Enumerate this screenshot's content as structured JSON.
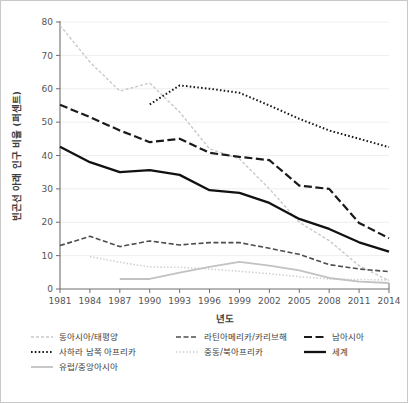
{
  "chart_data": {
    "type": "line",
    "title": "",
    "xlabel": "년도",
    "ylabel": "빈곤선 아래 인구 비율 (퍼센트)",
    "xlim": [
      1981,
      2014
    ],
    "ylim": [
      0,
      80
    ],
    "ytick_step": 10,
    "grid": true,
    "legend_position": "bottom",
    "x": [
      1981,
      1984,
      1987,
      1990,
      1993,
      1996,
      1999,
      2002,
      2005,
      2008,
      2011,
      2014
    ],
    "xtick_labels": [
      "1981",
      "1984",
      "1987",
      "1990",
      "1993",
      "1996",
      "1999",
      "2002",
      "2005",
      "2008",
      "2011",
      "2014"
    ],
    "ytick_labels": [
      "0",
      "10",
      "20",
      "30",
      "40",
      "50",
      "60",
      "70",
      "80"
    ],
    "series": [
      {
        "name": "동아시아/태평양",
        "color": "#c9c9c9",
        "width": 1.4,
        "dash": "3,2",
        "values": [
          79.0,
          68.0,
          59.3,
          61.7,
          53.0,
          42.0,
          39.0,
          30.0,
          20.0,
          14.5,
          7.0,
          2.5
        ]
      },
      {
        "name": "라틴아메리카/카리브해",
        "color": "#4d4d4d",
        "width": 1.6,
        "dash": "5,2.5",
        "values": [
          13.0,
          15.8,
          12.7,
          14.4,
          13.2,
          13.9,
          13.9,
          12.2,
          10.4,
          7.3,
          6.0,
          5.2
        ]
      },
      {
        "name": "남아시아",
        "color": "#1a1a1a",
        "width": 2.2,
        "dash": "8,3.5",
        "values": [
          55.2,
          51.5,
          47.5,
          44.0,
          45.0,
          40.8,
          39.6,
          38.6,
          31.0,
          30.0,
          19.8,
          15.2
        ]
      },
      {
        "name": "사하라 남쪽 아프리카",
        "color": "#1a1a1a",
        "width": 2.0,
        "dash": "1.6,2.2",
        "values": [
          null,
          null,
          null,
          55.3,
          61.0,
          60.0,
          58.8,
          55.0,
          51.0,
          47.5,
          45.0,
          42.5
        ]
      },
      {
        "name": "중동/북아프리카",
        "color": "#cfcfcf",
        "width": 1.6,
        "dash": "1.4,2",
        "values": [
          null,
          9.7,
          8.0,
          6.6,
          6.5,
          6.0,
          5.3,
          4.6,
          3.7,
          3.0,
          2.8,
          2.7
        ]
      },
      {
        "name": "유럽/중앙아시아",
        "color": "#c2c2c2",
        "width": 1.8,
        "dash": "",
        "values": [
          null,
          null,
          3.0,
          3.0,
          4.9,
          6.6,
          8.1,
          7.0,
          5.6,
          3.3,
          2.2,
          1.8
        ]
      },
      {
        "name": "세계",
        "color": "#111111",
        "width": 2.3,
        "dash": "",
        "values": [
          42.6,
          38.0,
          35.0,
          35.6,
          34.2,
          29.6,
          28.8,
          25.8,
          21.0,
          18.0,
          14.0,
          11.2
        ]
      }
    ],
    "legend_layout": [
      [
        "동아시아/태평양",
        "라틴아메리카/카리브해",
        "남아시아"
      ],
      [
        "사하라 남쪽 아프리카",
        "중동/북아프리카",
        "세계"
      ],
      [
        "유럽/중앙아시아",
        null,
        null
      ]
    ]
  }
}
